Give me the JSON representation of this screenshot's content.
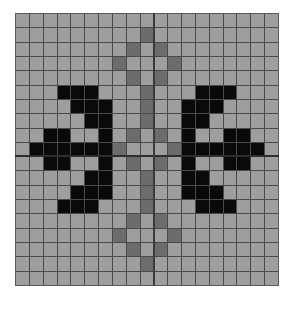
{
  "puzzle": {
    "rows": 19,
    "cols": 19,
    "colors": {
      "empty": "#9e9e9e",
      "marked": "#6c6c6c",
      "filled": "#0a0a0a",
      "gridline": "#4a4a4a"
    },
    "cells": [
      [
        0,
        0,
        0,
        0,
        0,
        0,
        0,
        0,
        0,
        0,
        0,
        0,
        0,
        0,
        0,
        0,
        0,
        0,
        0
      ],
      [
        0,
        0,
        0,
        0,
        0,
        0,
        0,
        0,
        0,
        1,
        0,
        0,
        0,
        0,
        0,
        0,
        0,
        0,
        0
      ],
      [
        0,
        0,
        0,
        0,
        0,
        0,
        0,
        0,
        1,
        0,
        1,
        0,
        0,
        0,
        0,
        0,
        0,
        0,
        0
      ],
      [
        0,
        0,
        0,
        0,
        0,
        0,
        0,
        1,
        0,
        0,
        0,
        1,
        0,
        0,
        0,
        0,
        0,
        0,
        0
      ],
      [
        0,
        0,
        0,
        0,
        0,
        0,
        0,
        0,
        1,
        0,
        1,
        0,
        0,
        0,
        0,
        0,
        0,
        0,
        0
      ],
      [
        0,
        0,
        0,
        2,
        2,
        2,
        0,
        0,
        0,
        1,
        0,
        0,
        0,
        2,
        2,
        2,
        0,
        0,
        0
      ],
      [
        0,
        0,
        0,
        0,
        2,
        2,
        2,
        0,
        0,
        1,
        0,
        0,
        2,
        2,
        2,
        0,
        0,
        0,
        0
      ],
      [
        0,
        0,
        0,
        0,
        0,
        2,
        2,
        0,
        0,
        1,
        0,
        0,
        2,
        2,
        0,
        0,
        0,
        0,
        0
      ],
      [
        0,
        0,
        2,
        2,
        0,
        0,
        2,
        0,
        1,
        0,
        1,
        0,
        2,
        0,
        0,
        2,
        2,
        0,
        0
      ],
      [
        0,
        2,
        2,
        2,
        2,
        2,
        2,
        1,
        0,
        0,
        0,
        1,
        2,
        2,
        2,
        2,
        2,
        2,
        0
      ],
      [
        0,
        0,
        2,
        2,
        0,
        0,
        2,
        0,
        1,
        0,
        1,
        0,
        2,
        0,
        0,
        2,
        2,
        0,
        0
      ],
      [
        0,
        0,
        0,
        0,
        0,
        2,
        2,
        0,
        0,
        1,
        0,
        0,
        2,
        2,
        0,
        0,
        0,
        0,
        0
      ],
      [
        0,
        0,
        0,
        0,
        2,
        2,
        2,
        0,
        0,
        1,
        0,
        0,
        2,
        2,
        2,
        0,
        0,
        0,
        0
      ],
      [
        0,
        0,
        0,
        2,
        2,
        2,
        0,
        0,
        0,
        1,
        0,
        0,
        0,
        2,
        2,
        2,
        0,
        0,
        0
      ],
      [
        0,
        0,
        0,
        0,
        0,
        0,
        0,
        0,
        1,
        0,
        1,
        0,
        0,
        0,
        0,
        0,
        0,
        0,
        0
      ],
      [
        0,
        0,
        0,
        0,
        0,
        0,
        0,
        1,
        0,
        0,
        0,
        1,
        0,
        0,
        0,
        0,
        0,
        0,
        0
      ],
      [
        0,
        0,
        0,
        0,
        0,
        0,
        0,
        0,
        1,
        0,
        1,
        0,
        0,
        0,
        0,
        0,
        0,
        0,
        0
      ],
      [
        0,
        0,
        0,
        0,
        0,
        0,
        0,
        0,
        0,
        1,
        0,
        0,
        0,
        0,
        0,
        0,
        0,
        0,
        0
      ],
      [
        0,
        0,
        0,
        0,
        0,
        0,
        0,
        0,
        0,
        0,
        0,
        0,
        0,
        0,
        0,
        0,
        0,
        0,
        0
      ]
    ]
  }
}
